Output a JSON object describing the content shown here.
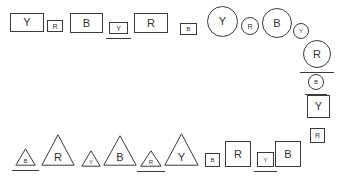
{
  "canvas": {
    "width": 342,
    "height": 180,
    "background": "#ffffff",
    "stroke_color": "#3a3a3a",
    "text_color": "#333333"
  },
  "legend": {
    "symbols": [
      "Y",
      "R",
      "B"
    ],
    "shape_kinds": [
      "rectangle",
      "square",
      "circle",
      "triangle"
    ]
  },
  "shapes": [
    {
      "id": "top-1",
      "kind": "rect",
      "label": "Y",
      "x": 10,
      "y": 13,
      "w": 34,
      "h": 19,
      "font": 11,
      "underlined": false
    },
    {
      "id": "top-2",
      "kind": "sq",
      "label": "R",
      "x": 47,
      "y": 20,
      "w": 16,
      "h": 12,
      "font": 7,
      "underlined": false
    },
    {
      "id": "top-3",
      "kind": "rect",
      "label": "B",
      "x": 70,
      "y": 13,
      "w": 33,
      "h": 20,
      "font": 11,
      "underlined": false
    },
    {
      "id": "top-4",
      "kind": "sq",
      "label": "Y",
      "x": 109,
      "y": 22,
      "w": 19,
      "h": 12,
      "font": 7,
      "underlined": true
    },
    {
      "id": "top-5",
      "kind": "rect",
      "label": "R",
      "x": 134,
      "y": 13,
      "w": 34,
      "h": 20,
      "font": 11,
      "underlined": false
    },
    {
      "id": "top-6",
      "kind": "sq",
      "label": "B",
      "x": 180,
      "y": 23,
      "w": 17,
      "h": 12,
      "font": 6,
      "underlined": false
    },
    {
      "id": "top-7",
      "circle": true,
      "kind": "circ",
      "label": "Y",
      "x": 207,
      "y": 6,
      "w": 31,
      "h": 31,
      "font": 11,
      "underlined": false
    },
    {
      "id": "top-8",
      "circle": true,
      "kind": "circ",
      "label": "R",
      "x": 241,
      "y": 17,
      "w": 18,
      "h": 18,
      "font": 7,
      "underlined": false
    },
    {
      "id": "top-9",
      "circle": true,
      "kind": "circ",
      "label": "B",
      "x": 262,
      "y": 8,
      "w": 30,
      "h": 30,
      "font": 11,
      "underlined": false
    },
    {
      "id": "rt-1",
      "circle": true,
      "kind": "circ",
      "label": "Y",
      "x": 293,
      "y": 23,
      "w": 16,
      "h": 16,
      "font": 6,
      "underlined": false
    },
    {
      "id": "rt-2",
      "circle": true,
      "kind": "circ",
      "label": "R",
      "x": 303,
      "y": 40,
      "w": 28,
      "h": 28,
      "font": 11,
      "underlined": true
    },
    {
      "id": "rt-3",
      "circle": true,
      "kind": "circ",
      "label": "B",
      "x": 308,
      "y": 74,
      "w": 16,
      "h": 16,
      "font": 6,
      "underlined": true
    },
    {
      "id": "rt-4",
      "kind": "sq",
      "label": "Y",
      "x": 307,
      "y": 95,
      "w": 23,
      "h": 23,
      "font": 11,
      "underlined": false
    },
    {
      "id": "rt-5",
      "kind": "sq",
      "label": "R",
      "x": 310,
      "y": 128,
      "w": 15,
      "h": 15,
      "font": 7,
      "underlined": false
    },
    {
      "id": "bot-1",
      "kind": "tri",
      "label": "B",
      "x": 15,
      "y": 148,
      "w": 21,
      "h": 18,
      "font": 6,
      "underlined": true
    },
    {
      "id": "bot-2",
      "kind": "tri",
      "label": "R",
      "x": 41,
      "y": 134,
      "w": 34,
      "h": 32,
      "font": 11,
      "underlined": false
    },
    {
      "id": "bot-3",
      "kind": "tri",
      "label": "Y",
      "x": 81,
      "y": 150,
      "w": 20,
      "h": 17,
      "font": 6,
      "underlined": false
    },
    {
      "id": "bot-4",
      "kind": "tri",
      "label": "B",
      "x": 103,
      "y": 135,
      "w": 34,
      "h": 31,
      "font": 11,
      "underlined": false
    },
    {
      "id": "bot-5",
      "kind": "tri",
      "label": "R",
      "x": 140,
      "y": 150,
      "w": 22,
      "h": 17,
      "font": 6,
      "underlined": true
    },
    {
      "id": "bot-6",
      "kind": "tri",
      "label": "Y",
      "x": 164,
      "y": 133,
      "w": 35,
      "h": 33,
      "font": 11,
      "underlined": false
    },
    {
      "id": "bot-7",
      "kind": "sq",
      "label": "B",
      "x": 205,
      "y": 153,
      "w": 15,
      "h": 14,
      "font": 6,
      "underlined": false
    },
    {
      "id": "bot-8",
      "kind": "sq",
      "label": "R",
      "x": 225,
      "y": 141,
      "w": 26,
      "h": 26,
      "font": 11,
      "underlined": false
    },
    {
      "id": "bot-9",
      "kind": "sq",
      "label": "Y",
      "x": 257,
      "y": 152,
      "w": 17,
      "h": 15,
      "font": 6,
      "underlined": true
    },
    {
      "id": "bot-10",
      "kind": "sq",
      "label": "B",
      "x": 275,
      "y": 141,
      "w": 26,
      "h": 26,
      "font": 11,
      "underlined": false
    }
  ]
}
